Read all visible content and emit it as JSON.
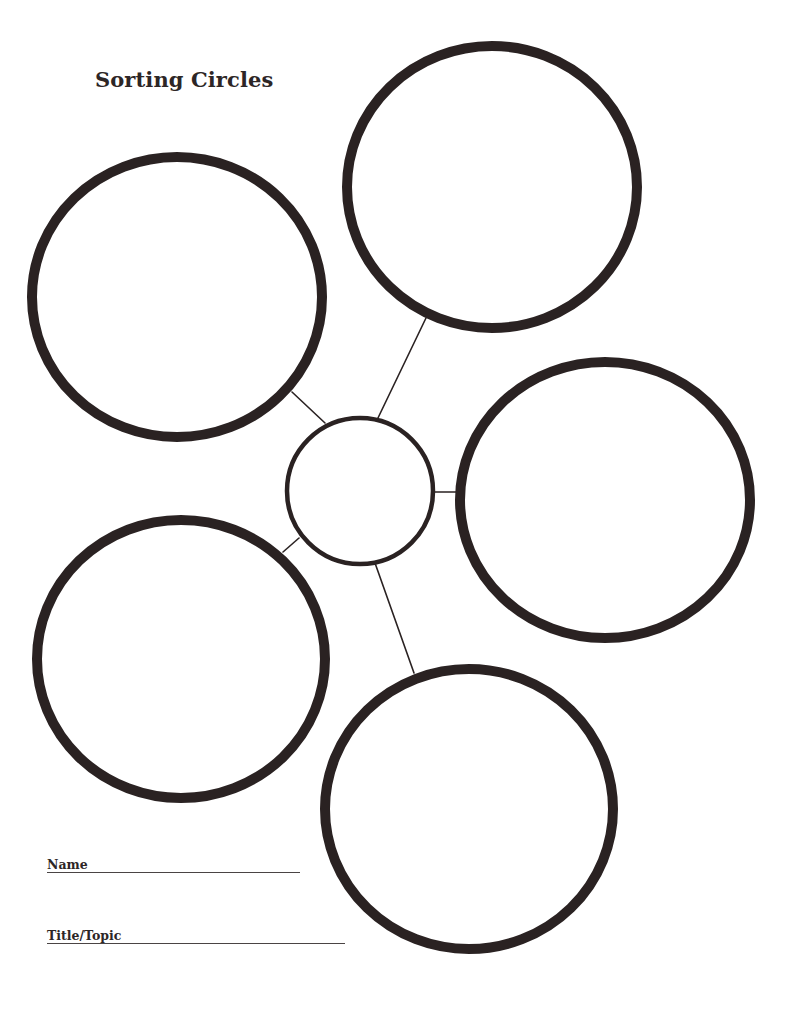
{
  "worksheet": {
    "title": "Sorting Circles",
    "stroke_color": "#2a2222",
    "center_circle": {
      "cx": 360,
      "cy": 491,
      "r": 73
    },
    "outer_circles": [
      {
        "id": "top",
        "cx": 492,
        "cy": 187,
        "rx": 145,
        "ry": 141
      },
      {
        "id": "upper-left",
        "cx": 177,
        "cy": 297,
        "rx": 145,
        "ry": 140
      },
      {
        "id": "right",
        "cx": 605,
        "cy": 500,
        "rx": 145,
        "ry": 138
      },
      {
        "id": "lower-left",
        "cx": 181,
        "cy": 659,
        "rx": 144,
        "ry": 139
      },
      {
        "id": "bottom",
        "cx": 469,
        "cy": 809,
        "rx": 144,
        "ry": 140
      }
    ],
    "connectors": [
      {
        "to": "top",
        "x1": 377,
        "y1": 420,
        "x2": 426,
        "y2": 318
      },
      {
        "to": "upper-left",
        "x1": 325,
        "y1": 423,
        "x2": 292,
        "y2": 392
      },
      {
        "to": "right",
        "x1": 435,
        "y1": 492,
        "x2": 457,
        "y2": 492
      },
      {
        "to": "lower-left",
        "x1": 299,
        "y1": 538,
        "x2": 283,
        "y2": 552
      },
      {
        "to": "bottom",
        "x1": 375,
        "y1": 563,
        "x2": 414,
        "y2": 673
      }
    ]
  },
  "fields": {
    "name_label": "Name",
    "title_label": "Title/Topic"
  }
}
